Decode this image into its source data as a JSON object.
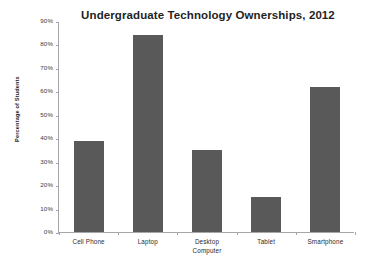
{
  "chart_data": {
    "type": "bar",
    "title": "Undergraduate Technology Ownerships, 2012",
    "xlabel": "",
    "ylabel": "Percentage of Students",
    "categories": [
      "Cell Phone",
      "Laptop",
      "Desktop Computer",
      "Tablet",
      "Smartphone"
    ],
    "values": [
      39,
      84,
      35,
      15,
      62
    ],
    "ylim": [
      0,
      90
    ],
    "ytick_labels": [
      "90%",
      "80%",
      "70%",
      "60%",
      "50%",
      "40%",
      "30%",
      "20%",
      "10%",
      "0%"
    ],
    "ytick_values": [
      90,
      80,
      70,
      60,
      50,
      40,
      30,
      20,
      10,
      0
    ],
    "grid": false,
    "legend": null,
    "series": [
      {
        "name": "Percentage of Students",
        "values": [
          39,
          84,
          35,
          15,
          62
        ],
        "color": "#595959"
      }
    ],
    "colors": {
      "bar_fill": "#595959",
      "axis_line": "#a6a6a6",
      "text": "#2b2b2b",
      "background": "#ffffff"
    }
  },
  "axis": {
    "y_title": "Percentage of Students",
    "ticks": [
      {
        "label": "90%",
        "value": 90
      },
      {
        "label": "80%",
        "value": 80
      },
      {
        "label": "70%",
        "value": 70
      },
      {
        "label": "60%",
        "value": 60
      },
      {
        "label": "50%",
        "value": 50
      },
      {
        "label": "40%",
        "value": 40
      },
      {
        "label": "30%",
        "value": 30
      },
      {
        "label": "20%",
        "value": 20
      },
      {
        "label": "10%",
        "value": 10
      },
      {
        "label": "0%",
        "value": 0
      }
    ]
  },
  "categories": [
    {
      "line1": "Cell Phone",
      "line2": ""
    },
    {
      "line1": "Laptop",
      "line2": ""
    },
    {
      "line1": "Desktop",
      "line2": "Computer"
    },
    {
      "line1": "Tablet",
      "line2": ""
    },
    {
      "line1": "Smartphone",
      "line2": ""
    }
  ]
}
